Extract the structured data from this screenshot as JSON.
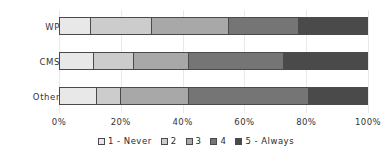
{
  "chart_data": {
    "type": "bar",
    "orientation": "horizontal",
    "stacked": true,
    "normalized_percent": true,
    "title": "",
    "subtitle": "",
    "xlabel": "",
    "ylabel": "",
    "categories": [
      "WP",
      "CMS",
      "Other"
    ],
    "xlim": [
      0,
      100
    ],
    "xticks": [
      0,
      20,
      40,
      60,
      80,
      100
    ],
    "xtick_labels": [
      "0%",
      "20%",
      "40%",
      "60%",
      "80%",
      "100%"
    ],
    "grid": true,
    "legend_position": "bottom",
    "series": [
      {
        "name": "1 - Never",
        "color": "#e8e8e8",
        "values": [
          10,
          11,
          12
        ]
      },
      {
        "name": "2",
        "color": "#cccccc",
        "values": [
          20,
          13,
          8
        ]
      },
      {
        "name": "3",
        "color": "#a8a8a8",
        "values": [
          25,
          18,
          22
        ]
      },
      {
        "name": "4",
        "color": "#757575",
        "values": [
          23,
          31,
          39
        ]
      },
      {
        "name": "5 - Always",
        "color": "#4a4a4a",
        "values": [
          22,
          27,
          19
        ]
      }
    ]
  }
}
